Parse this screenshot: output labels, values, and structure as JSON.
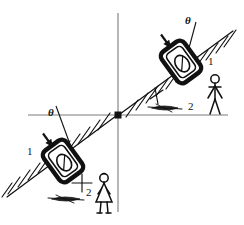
{
  "figure": {
    "background_color": "#ffffff",
    "ink_color": "#111111",
    "axis_color": "#7a7a7a",
    "width": 244,
    "height": 225
  },
  "axes": {
    "origin_marker": "filled-square",
    "origin": {
      "x": 118,
      "y": 115
    },
    "horizontal": {
      "x1": 28,
      "y1": 115,
      "x2": 228,
      "y2": 115
    },
    "vertical": {
      "x1": 118,
      "y1": 13,
      "x2": 118,
      "y2": 212
    }
  },
  "slopes": [
    {
      "id": "upper-right-slope",
      "x1": 118,
      "y1": 115,
      "x2": 232,
      "y2": 32,
      "hatch_count": 11,
      "label_1": "1",
      "label_2": "2"
    },
    {
      "id": "lower-left-slope",
      "x1": 118,
      "y1": 115,
      "x2": 8,
      "y2": 196,
      "hatch_count": 11,
      "label_1": "1",
      "label_2": "2"
    }
  ],
  "labels": {
    "theta_upper": "θ",
    "theta_lower": "θ",
    "one_upper": "1",
    "two_upper": "2",
    "one_lower": "1",
    "two_lower": "2"
  },
  "objects": [
    {
      "id": "upper-speaker-box",
      "kind": "loudspeaker-box",
      "center": {
        "x": 181,
        "y": 62
      },
      "rotation_deg": -36,
      "width": 26,
      "height": 36,
      "has_inner_cone": true,
      "arrow_label": "θ"
    },
    {
      "id": "lower-speaker-box",
      "kind": "loudspeaker-box",
      "center": {
        "x": 63,
        "y": 161
      },
      "rotation_deg": -36,
      "width": 26,
      "height": 36,
      "has_inner_cone": true,
      "arrow_label": "θ"
    }
  ],
  "people": [
    {
      "id": "man-figure",
      "kind": "standing-man",
      "x": 215,
      "y": 95,
      "scale": 1.0
    },
    {
      "id": "girl-figure",
      "kind": "standing-girl-dress",
      "x": 104,
      "y": 195,
      "scale": 1.0
    }
  ],
  "ground_smudges": [
    {
      "id": "upper-smudge",
      "x": 166,
      "y": 108
    },
    {
      "id": "lower-smudge",
      "x": 66,
      "y": 199
    }
  ]
}
